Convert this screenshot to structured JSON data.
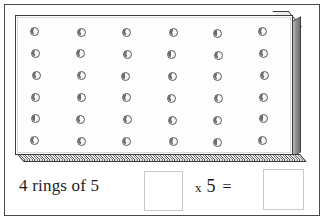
{
  "worksheet": {
    "pegboard": {
      "name": "ring-pegboard",
      "columns": 6,
      "rows": 6,
      "total_rings": 36,
      "ring_icon": "ring-icon"
    },
    "answer_row": {
      "prompt_text": "4 rings of 5",
      "first_answer_value": "",
      "first_answer_placeholder": "",
      "operator_times": "x",
      "operand": "5",
      "operator_equals": "=",
      "result_value": "",
      "result_placeholder": ""
    }
  },
  "colors": {
    "frame_border": "#4a4a4a",
    "board_outline": "#3b3b3b",
    "ring_outline": "#5d5d5d",
    "bevel_gray": "#8e8e8e",
    "answer_box_border": "#c9c9c9",
    "text": "#1d1d1d"
  }
}
